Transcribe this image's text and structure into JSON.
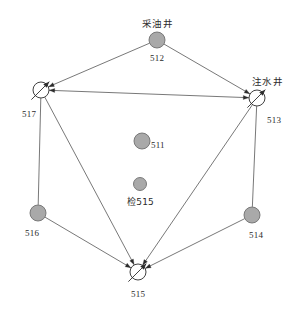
{
  "diagram": {
    "background_color": "#ffffff",
    "line_color": "#555555",
    "node_fill": "#a9a9a9",
    "node_stroke": "#6f6f6f",
    "symbol_stroke": "#2b2b2b",
    "nodes": [
      {
        "id": "512",
        "label": "512",
        "type_label": "采油井",
        "symbol": "filled-circle",
        "x": 157,
        "y": 40,
        "r": 8,
        "label_dx": 0,
        "label_dy": 18,
        "type_dx": 0,
        "type_dy": -16
      },
      {
        "id": "513",
        "label": "513",
        "type_label": "注水井",
        "symbol": "injection-arrow-circle",
        "x": 257,
        "y": 98,
        "r": 8,
        "label_dx": 17,
        "label_dy": 22,
        "type_dx": 10,
        "type_dy": -16
      },
      {
        "id": "514",
        "label": "514",
        "type_label": "",
        "symbol": "filled-circle",
        "x": 252,
        "y": 215,
        "r": 8,
        "label_dx": 4,
        "label_dy": 20,
        "type_dx": 0,
        "type_dy": 0
      },
      {
        "id": "515",
        "label": "515",
        "type_label": "",
        "symbol": "injection-arrow-circle",
        "x": 138,
        "y": 272,
        "r": 8,
        "label_dx": 0,
        "label_dy": 22,
        "type_dx": 0,
        "type_dy": 0
      },
      {
        "id": "516",
        "label": "516",
        "type_label": "",
        "symbol": "filled-circle",
        "x": 38,
        "y": 213,
        "r": 8,
        "label_dx": -6,
        "label_dy": 20,
        "type_dx": 0,
        "type_dy": 0
      },
      {
        "id": "517",
        "label": "517",
        "type_label": "",
        "symbol": "injection-arrow-circle",
        "x": 41,
        "y": 90,
        "r": 8,
        "label_dx": -12,
        "label_dy": 24,
        "type_dx": 0,
        "type_dy": 0
      },
      {
        "id": "511",
        "label": "511",
        "type_label": "",
        "symbol": "filled-circle",
        "x": 142,
        "y": 141,
        "r": 8,
        "label_dx": 16,
        "label_dy": 4,
        "type_dx": 0,
        "type_dy": 0
      },
      {
        "id": "jian515",
        "label": "检515",
        "type_label": "",
        "symbol": "filled-circle",
        "x": 140,
        "y": 184,
        "r": 6.5,
        "label_dx": 0,
        "label_dy": 18,
        "type_dx": 0,
        "type_dy": 0
      }
    ],
    "edges": [
      {
        "from": "512",
        "to": "517",
        "arrow_at": "to"
      },
      {
        "from": "512",
        "to": "513",
        "arrow_at": "to"
      },
      {
        "from": "517",
        "to": "513",
        "arrow_at": "both"
      },
      {
        "from": "517",
        "to": "516",
        "arrow_at": "none"
      },
      {
        "from": "517",
        "to": "515",
        "arrow_at": "to"
      },
      {
        "from": "516",
        "to": "515",
        "arrow_at": "to"
      },
      {
        "from": "513",
        "to": "514",
        "arrow_at": "none"
      },
      {
        "from": "513",
        "to": "515",
        "arrow_at": "to"
      },
      {
        "from": "514",
        "to": "515",
        "arrow_at": "to"
      }
    ],
    "legend": {
      "production_well": "采油井",
      "injection_well": "注水井",
      "inspection_well": "检515"
    }
  }
}
